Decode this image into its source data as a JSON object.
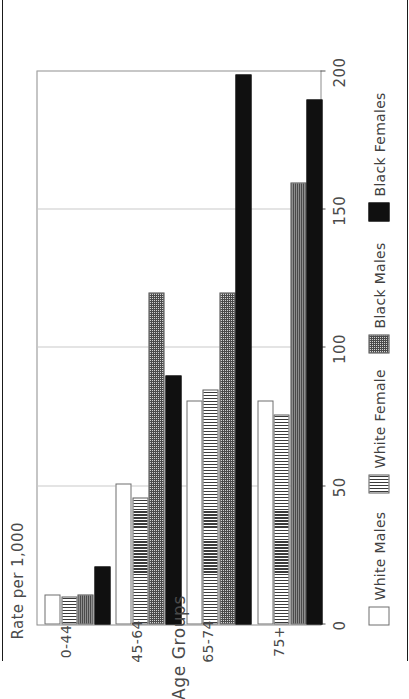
{
  "chart_data": {
    "type": "bar",
    "orientation": "horizontal",
    "title": "",
    "xlabel": "Age Groups",
    "ylabel": "Rate per 1,000",
    "categories": [
      "0-44",
      "45-64",
      "65-74",
      "75+"
    ],
    "axis_ticks": [
      "0",
      "50",
      "100",
      "150",
      "200"
    ],
    "ylim": [
      0,
      200
    ],
    "grid": true,
    "legend_position": "bottom",
    "series": [
      {
        "name": "White Males",
        "pattern": "white",
        "values": [
          11,
          51,
          81,
          81
        ]
      },
      {
        "name": "White Female",
        "pattern": "vertical-stripe",
        "values": [
          10,
          46,
          85,
          76
        ]
      },
      {
        "name": "Black Males",
        "pattern": "checkered",
        "values": [
          11,
          120,
          120,
          160
        ]
      },
      {
        "name": "Black Females",
        "pattern": "solid-black",
        "values": [
          21,
          90,
          199,
          190
        ]
      }
    ]
  },
  "legend": {
    "items": [
      {
        "label": "White Males"
      },
      {
        "label": "White Female"
      },
      {
        "label": "Black Males"
      },
      {
        "label": "Black Females"
      }
    ]
  },
  "axes": {
    "value_axis_label": "Rate per 1,000",
    "category_axis_label": "Age Groups",
    "value_ticks": [
      "0",
      "50",
      "100",
      "150",
      "200"
    ],
    "category_labels": [
      "0-44",
      "45-64",
      "65-74",
      "75+"
    ]
  },
  "colors": {
    "frame": "#8c8c8c",
    "grid": "#c9c9c9",
    "text": "#4a4a4a",
    "bar_dark": "#101010",
    "bar_light": "#ffffff",
    "page_border": "#1a1a1a"
  }
}
